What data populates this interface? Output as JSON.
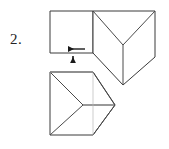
{
  "figure": {
    "item_number": "2.",
    "colors": {
      "stroke": "#3a3a3a",
      "stroke_light": "#6e6e6e",
      "fold_line": "#808080",
      "arrow": "#1a1a1a",
      "background": "#ffffff",
      "text": "#232323"
    },
    "stroke_width": "1",
    "caption": "",
    "shapes": {
      "top_square": {
        "name": "top-left-square-face",
        "points": "50,11 93,11 93,53 50,53"
      },
      "top_right_folded": {
        "name": "top-right-folded-face",
        "outline": "93,11 155,11 155,57 123,85 93,53",
        "fold_v_left": "93,11 123,45",
        "fold_v_right": "155,11 123,45",
        "fold_vertical": "123,45 123,85",
        "fold_lower_left": "93,53 123,85",
        "fold_lower_right": "155,57 123,85"
      },
      "bottom_shape": {
        "name": "bottom-folded-figure",
        "outline": "50,72 93,72 115,105 93,135 50,135",
        "fold_top_diag": "50,72 83,105",
        "fold_bottom_diag": "50,135 83,105",
        "fold_horizontal": "83,105 115,105",
        "fold_right_upper": "93,72 115,105",
        "fold_right_lower": "93,135 115,105",
        "left_edge": "50,72 50,135",
        "top_edge": "50,72 93,72",
        "bottom_edge": "50,135 93,135"
      }
    },
    "annotations": {
      "left_arrow": {
        "name": "left-pointing-arrow",
        "label": "",
        "shaft_from": "85,49",
        "shaft_to": "65,49",
        "direction": "left"
      },
      "down_arrow": {
        "name": "down-pointing-arrow",
        "label": "",
        "shaft_from": "73,56",
        "shaft_to": "73,66",
        "direction": "down"
      }
    }
  }
}
